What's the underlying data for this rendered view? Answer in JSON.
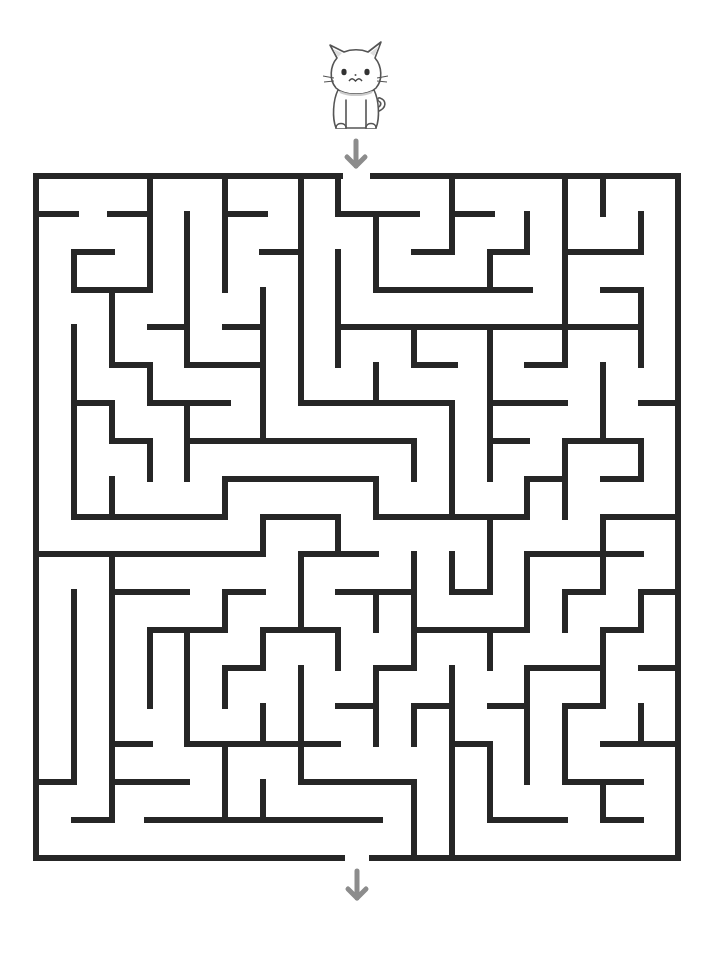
{
  "puzzle": {
    "title": "Cat maze",
    "type": "maze",
    "start_label": "Start",
    "end_label": "Finish",
    "character": "cat",
    "colors": {
      "wall": "#262626",
      "arrow": "#8c8c8c",
      "background": "#ffffff"
    }
  },
  "grid": {
    "cols": 17,
    "rows": 18,
    "left": 36,
    "top": 176,
    "right": 678,
    "bottom": 858
  },
  "entrance": {
    "x1": 340,
    "x2": 373,
    "y": 176
  },
  "exit": {
    "x1": 342,
    "x2": 372,
    "y": 858
  },
  "walls": [
    [
      36,
      176,
      340,
      176
    ],
    [
      373,
      176,
      678,
      176
    ],
    [
      36,
      858,
      342,
      858
    ],
    [
      372,
      858,
      678,
      858
    ],
    [
      36,
      176,
      36,
      858
    ],
    [
      678,
      176,
      678,
      858
    ],
    [
      36,
      214,
      76,
      214
    ],
    [
      110,
      214,
      150,
      214
    ],
    [
      150,
      176,
      150,
      290
    ],
    [
      74,
      252,
      112,
      252
    ],
    [
      74,
      252,
      74,
      290
    ],
    [
      74,
      290,
      150,
      290
    ],
    [
      112,
      290,
      112,
      365
    ],
    [
      112,
      365,
      150,
      365
    ],
    [
      150,
      365,
      150,
      403
    ],
    [
      150,
      403,
      228,
      403
    ],
    [
      150,
      327,
      187,
      327
    ],
    [
      187,
      214,
      187,
      365
    ],
    [
      187,
      365,
      263,
      365
    ],
    [
      225,
      176,
      225,
      290
    ],
    [
      225,
      214,
      265,
      214
    ],
    [
      262,
      252,
      301,
      252
    ],
    [
      225,
      327,
      263,
      327
    ],
    [
      263,
      290,
      263,
      441
    ],
    [
      301,
      176,
      301,
      403
    ],
    [
      301,
      403,
      452,
      403
    ],
    [
      338,
      176,
      338,
      214
    ],
    [
      338,
      214,
      417,
      214
    ],
    [
      338,
      252,
      338,
      365
    ],
    [
      338,
      327,
      641,
      327
    ],
    [
      376,
      214,
      376,
      290
    ],
    [
      376,
      290,
      530,
      290
    ],
    [
      414,
      252,
      452,
      252
    ],
    [
      452,
      176,
      452,
      252
    ],
    [
      452,
      214,
      492,
      214
    ],
    [
      527,
      214,
      527,
      252
    ],
    [
      490,
      252,
      527,
      252
    ],
    [
      490,
      252,
      490,
      290
    ],
    [
      565,
      176,
      565,
      365
    ],
    [
      603,
      176,
      603,
      214
    ],
    [
      641,
      214,
      641,
      252
    ],
    [
      565,
      252,
      641,
      252
    ],
    [
      603,
      290,
      641,
      290
    ],
    [
      641,
      290,
      641,
      365
    ],
    [
      414,
      327,
      414,
      365
    ],
    [
      414,
      365,
      455,
      365
    ],
    [
      376,
      365,
      376,
      403
    ],
    [
      527,
      365,
      565,
      365
    ],
    [
      74,
      327,
      74,
      517
    ],
    [
      74,
      403,
      112,
      403
    ],
    [
      112,
      403,
      112,
      441
    ],
    [
      112,
      441,
      150,
      441
    ],
    [
      150,
      441,
      150,
      479
    ],
    [
      187,
      403,
      187,
      479
    ],
    [
      187,
      441,
      414,
      441
    ],
    [
      414,
      441,
      414,
      479
    ],
    [
      112,
      479,
      112,
      517
    ],
    [
      74,
      517,
      225,
      517
    ],
    [
      225,
      479,
      225,
      517
    ],
    [
      225,
      479,
      376,
      479
    ],
    [
      376,
      479,
      376,
      517
    ],
    [
      376,
      517,
      527,
      517
    ],
    [
      452,
      403,
      452,
      517
    ],
    [
      490,
      327,
      490,
      479
    ],
    [
      490,
      403,
      565,
      403
    ],
    [
      490,
      441,
      527,
      441
    ],
    [
      527,
      479,
      565,
      479
    ],
    [
      527,
      479,
      527,
      517
    ],
    [
      565,
      441,
      565,
      517
    ],
    [
      565,
      441,
      641,
      441
    ],
    [
      641,
      441,
      641,
      479
    ],
    [
      603,
      479,
      641,
      479
    ],
    [
      603,
      365,
      603,
      441
    ],
    [
      641,
      403,
      678,
      403
    ],
    [
      603,
      517,
      678,
      517
    ],
    [
      490,
      517,
      490,
      592
    ],
    [
      36,
      554,
      263,
      554
    ],
    [
      263,
      517,
      263,
      554
    ],
    [
      263,
      517,
      338,
      517
    ],
    [
      338,
      517,
      338,
      554
    ],
    [
      301,
      554,
      376,
      554
    ],
    [
      112,
      554,
      112,
      820
    ],
    [
      74,
      592,
      74,
      782
    ],
    [
      36,
      782,
      74,
      782
    ],
    [
      74,
      820,
      112,
      820
    ],
    [
      112,
      592,
      187,
      592
    ],
    [
      225,
      592,
      263,
      592
    ],
    [
      225,
      592,
      225,
      630
    ],
    [
      150,
      630,
      225,
      630
    ],
    [
      150,
      630,
      150,
      706
    ],
    [
      187,
      630,
      187,
      744
    ],
    [
      301,
      554,
      301,
      630
    ],
    [
      263,
      630,
      338,
      630
    ],
    [
      263,
      630,
      263,
      668
    ],
    [
      225,
      668,
      263,
      668
    ],
    [
      225,
      668,
      225,
      706
    ],
    [
      338,
      630,
      338,
      668
    ],
    [
      301,
      668,
      301,
      782
    ],
    [
      414,
      554,
      414,
      668
    ],
    [
      338,
      592,
      414,
      592
    ],
    [
      376,
      592,
      376,
      630
    ],
    [
      452,
      554,
      452,
      592
    ],
    [
      452,
      592,
      490,
      592
    ],
    [
      414,
      630,
      527,
      630
    ],
    [
      527,
      554,
      527,
      630
    ],
    [
      527,
      554,
      641,
      554
    ],
    [
      603,
      517,
      603,
      592
    ],
    [
      565,
      592,
      603,
      592
    ],
    [
      565,
      592,
      565,
      630
    ],
    [
      641,
      592,
      678,
      592
    ],
    [
      641,
      592,
      641,
      630
    ],
    [
      603,
      630,
      641,
      630
    ],
    [
      603,
      630,
      603,
      706
    ],
    [
      490,
      630,
      490,
      668
    ],
    [
      376,
      668,
      414,
      668
    ],
    [
      376,
      668,
      376,
      744
    ],
    [
      527,
      668,
      603,
      668
    ],
    [
      527,
      668,
      527,
      782
    ],
    [
      641,
      668,
      678,
      668
    ],
    [
      452,
      668,
      452,
      858
    ],
    [
      414,
      706,
      452,
      706
    ],
    [
      414,
      706,
      414,
      744
    ],
    [
      338,
      706,
      376,
      706
    ],
    [
      490,
      706,
      527,
      706
    ],
    [
      565,
      706,
      603,
      706
    ],
    [
      565,
      706,
      565,
      782
    ],
    [
      641,
      706,
      641,
      744
    ],
    [
      112,
      744,
      150,
      744
    ],
    [
      112,
      782,
      187,
      782
    ],
    [
      187,
      744,
      338,
      744
    ],
    [
      225,
      744,
      225,
      820
    ],
    [
      263,
      706,
      263,
      744
    ],
    [
      263,
      782,
      263,
      820
    ],
    [
      147,
      820,
      380,
      820
    ],
    [
      301,
      782,
      414,
      782
    ],
    [
      414,
      782,
      414,
      858
    ],
    [
      452,
      744,
      490,
      744
    ],
    [
      490,
      744,
      490,
      820
    ],
    [
      490,
      820,
      565,
      820
    ],
    [
      565,
      782,
      641,
      782
    ],
    [
      603,
      782,
      603,
      820
    ],
    [
      603,
      820,
      641,
      820
    ],
    [
      603,
      744,
      678,
      744
    ]
  ]
}
